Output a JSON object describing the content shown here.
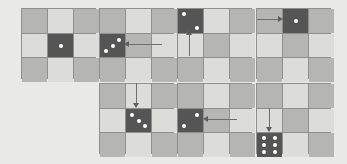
{
  "colors": {
    "background": "#e9e9e8",
    "grid_line": "#8f8f8f",
    "cell_mid": "#b5b5b4",
    "cell_light": "#dcdcdb",
    "die_face": "#555555",
    "pip": "#ffffff",
    "arrow": "#6e6e6e"
  },
  "panels": [
    {
      "step": 1,
      "die_cell": [
        1,
        1
      ],
      "die_value": 1,
      "arrow": null
    },
    {
      "step": 2,
      "die_cell": [
        1,
        0
      ],
      "die_value": 3,
      "arrow": {
        "from": [
          1,
          2
        ],
        "to": [
          1,
          0
        ],
        "direction": "left"
      }
    },
    {
      "step": 3,
      "die_cell": [
        0,
        0
      ],
      "die_value": 2,
      "arrow": {
        "from": [
          1,
          0
        ],
        "to": [
          0,
          0
        ],
        "direction": "up"
      }
    },
    {
      "step": 4,
      "die_cell": [
        0,
        1
      ],
      "die_value": 1,
      "arrow": {
        "from": [
          0,
          0
        ],
        "to": [
          0,
          1
        ],
        "direction": "right"
      }
    },
    {
      "step": 5,
      "die_cell": [
        1,
        1
      ],
      "die_value": 3,
      "arrow": {
        "from": [
          0,
          1
        ],
        "to": [
          1,
          1
        ],
        "direction": "down"
      }
    },
    {
      "step": 6,
      "die_cell": [
        1,
        0
      ],
      "die_value": 2,
      "arrow": {
        "from": [
          1,
          1
        ],
        "to": [
          1,
          0
        ],
        "direction": "left"
      }
    },
    {
      "step": 7,
      "die_cell": [
        2,
        0
      ],
      "die_value": 6,
      "arrow": {
        "from": [
          1,
          0
        ],
        "to": [
          2,
          0
        ],
        "direction": "down"
      }
    }
  ]
}
